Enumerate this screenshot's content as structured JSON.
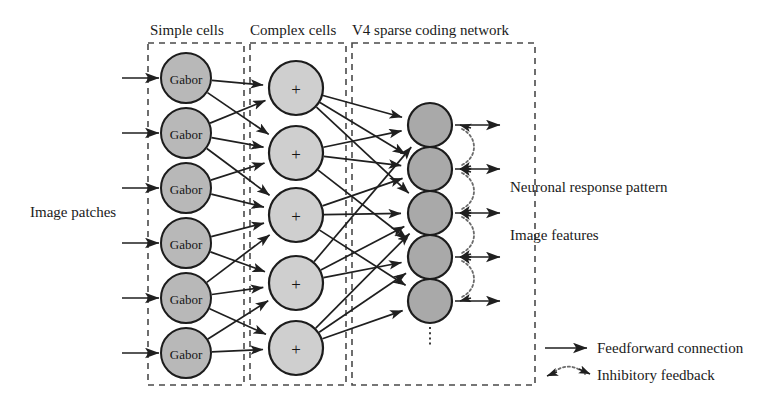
{
  "diagram": {
    "boxes": [
      {
        "name": "simple-cells",
        "title": "Simple cells",
        "x": 148,
        "y": 43,
        "w": 96,
        "h": 342,
        "title_x": 150,
        "title_y": 35
      },
      {
        "name": "complex-cells",
        "title": "Complex cells",
        "x": 250,
        "y": 43,
        "w": 96,
        "h": 342,
        "title_x": 250,
        "title_y": 35
      },
      {
        "name": "v4-network",
        "title": "V4 sparse coding network",
        "x": 352,
        "y": 43,
        "w": 183,
        "h": 342,
        "title_x": 352,
        "title_y": 35
      }
    ],
    "simple_cells": {
      "layer_name": "Simple cells",
      "node_label": "Gabor",
      "count": 6,
      "cx": 186,
      "r": 25,
      "cy": [
        78,
        133,
        188,
        243,
        298,
        353
      ]
    },
    "complex_cells": {
      "layer_name": "Complex cells",
      "node_label": "+",
      "count": 5,
      "cx": 296,
      "r": 27,
      "cy": [
        88,
        153,
        215,
        283,
        348
      ]
    },
    "v4_cells": {
      "layer_name": "V4 sparse coding network",
      "count": 5,
      "cx": 430,
      "r": 22,
      "cy": [
        125,
        169,
        213,
        257,
        301
      ],
      "ellipsis": {
        "x": 430,
        "y1": 327,
        "y2": 345
      }
    },
    "input_arrows": {
      "name": "image-patch-inputs",
      "count": 6,
      "x_start": 122,
      "x_end": 159,
      "y": [
        78,
        133,
        188,
        243,
        298,
        353
      ]
    },
    "output_arrows": {
      "name": "v4-outputs",
      "count": 5,
      "x_start": 455,
      "x_end": 500,
      "y": [
        125,
        169,
        213,
        257,
        301
      ]
    },
    "feedback_arcs": {
      "name": "inhibitory-feedback",
      "count": 4,
      "pairs": [
        [
          125,
          169
        ],
        [
          169,
          213
        ],
        [
          213,
          257
        ],
        [
          257,
          301
        ]
      ],
      "x_out": 462,
      "x_bulge": 472
    },
    "simple_to_complex": [
      [
        0,
        0
      ],
      [
        0,
        1
      ],
      [
        1,
        0
      ],
      [
        1,
        1
      ],
      [
        1,
        2
      ],
      [
        2,
        1
      ],
      [
        2,
        2
      ],
      [
        3,
        2
      ],
      [
        3,
        3
      ],
      [
        4,
        2
      ],
      [
        4,
        3
      ],
      [
        4,
        4
      ],
      [
        5,
        3
      ],
      [
        5,
        4
      ]
    ],
    "complex_to_v4": [
      [
        0,
        0
      ],
      [
        0,
        1
      ],
      [
        0,
        2
      ],
      [
        1,
        0
      ],
      [
        1,
        1
      ],
      [
        1,
        3
      ],
      [
        2,
        1
      ],
      [
        2,
        2
      ],
      [
        2,
        4
      ],
      [
        3,
        0
      ],
      [
        3,
        2
      ],
      [
        3,
        3
      ],
      [
        4,
        2
      ],
      [
        4,
        3
      ],
      [
        4,
        4
      ]
    ],
    "side_labels": [
      {
        "name": "image-patches-label",
        "text": "Image patches",
        "x": 30,
        "y": 217,
        "anchor": "start"
      },
      {
        "name": "neuronal-response-label",
        "text": "Neuronal response pattern",
        "x": 510,
        "y": 192,
        "anchor": "start"
      },
      {
        "name": "image-features-label",
        "text": "Image features",
        "x": 510,
        "y": 240,
        "anchor": "start"
      }
    ],
    "legend": {
      "name": "legend",
      "items": [
        {
          "name": "legend-feedforward",
          "label": "Feedforward connection",
          "type": "solid-arrow",
          "x": 545,
          "y": 348,
          "label_x": 597
        },
        {
          "name": "legend-inhibitory",
          "label": "Inhibitory feedback",
          "type": "dotted-arc",
          "x": 545,
          "y": 375,
          "label_x": 597
        }
      ]
    },
    "colors": {
      "gabor_fill": "#b8b8b8",
      "complex_fill": "#cfcfcf",
      "v4_fill": "#a9a9a9",
      "stroke": "#1c1c1c",
      "dash_box": "#4a4a4a",
      "inhibitory": "#6b6b6b",
      "background": "#ffffff"
    }
  }
}
